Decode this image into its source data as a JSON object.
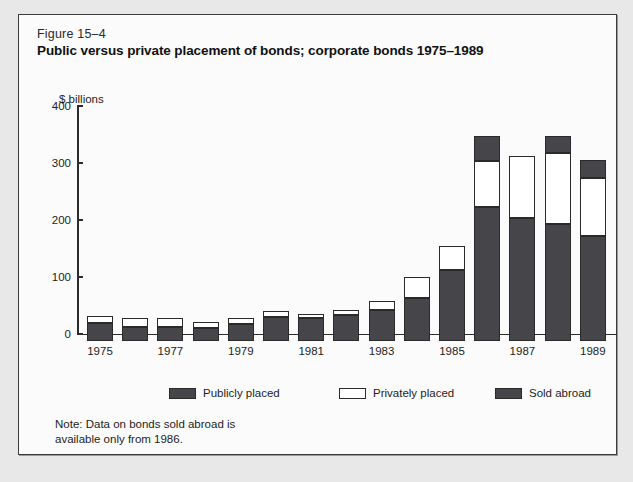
{
  "figure": {
    "number": "Figure 15–4",
    "title": "Public versus private placement of bonds; corporate bonds 1975–1989"
  },
  "note": {
    "line1": "Note: Data on bonds sold abroad is",
    "line2": "available only from 1986."
  },
  "legend": [
    {
      "label": "Publicly placed",
      "swatch": "dark",
      "color": "#46464a"
    },
    {
      "label": "Privately placed",
      "swatch": "white",
      "color": "#ffffff"
    },
    {
      "label": "Sold abroad",
      "swatch": "dark",
      "color": "#46464a"
    }
  ],
  "chart_data": {
    "type": "bar",
    "stacked": true,
    "title": "Public versus private placement of bonds; corporate bonds 1975–1989",
    "xlabel": "",
    "ylabel": "$ billions",
    "ylim": [
      0,
      400
    ],
    "yticks": [
      0,
      100,
      200,
      300,
      400
    ],
    "ytick_labels": [
      "0",
      "100",
      "200",
      "300",
      "400"
    ],
    "grid": false,
    "legend_position": "bottom",
    "categories": [
      1975,
      1976,
      1977,
      1978,
      1979,
      1980,
      1981,
      1982,
      1983,
      1984,
      1985,
      1986,
      1987,
      1988,
      1989
    ],
    "xtick_labels_shown": [
      "1975",
      "1977",
      "1979",
      "1981",
      "1983",
      "1985",
      "1987",
      "1989"
    ],
    "series": [
      {
        "name": "Publicly placed",
        "color": "#46464a",
        "values": [
          31,
          25,
          25,
          22,
          29,
          43,
          40,
          45,
          54,
          76,
          125,
          235,
          215,
          205,
          184
        ]
      },
      {
        "name": "Privately placed",
        "color": "#ffffff",
        "values": [
          13,
          16,
          16,
          12,
          11,
          9,
          8,
          10,
          16,
          36,
          42,
          80,
          110,
          125,
          102
        ]
      },
      {
        "name": "Sold abroad",
        "color": "#46464a",
        "values": [
          0,
          0,
          0,
          0,
          0,
          0,
          0,
          0,
          0,
          0,
          0,
          45,
          0,
          30,
          32
        ]
      }
    ],
    "totals": [
      44,
      41,
      41,
      34,
      40,
      52,
      48,
      55,
      70,
      112,
      167,
      360,
      325,
      360,
      318
    ]
  }
}
